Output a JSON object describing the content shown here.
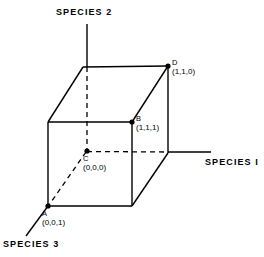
{
  "figure": {
    "type": "3d-cube-diagram",
    "background_color": "#ffffff",
    "line_color": "#000000"
  },
  "axes": {
    "species_1": {
      "label": "SPECIES I",
      "direction": "right",
      "solid_from_x": 168,
      "end_x": 210,
      "y": 152
    },
    "species_2": {
      "label": "SPECIES 2",
      "direction": "up",
      "x": 87,
      "top_y": 24
    },
    "species_3": {
      "label": "SPECIES 3",
      "direction": "down-left",
      "end_x": 27,
      "end_y": 234
    }
  },
  "vertices": [
    {
      "id": "A",
      "name": "A",
      "coord": "(0,0,1)",
      "px": 48,
      "py": 206,
      "dot": true
    },
    {
      "id": "B",
      "name": "B",
      "coord": "(1,1,1)",
      "px": 132,
      "py": 122,
      "dot": true
    },
    {
      "id": "C",
      "name": "C",
      "coord": "(0,0,0)",
      "px": 87,
      "py": 151,
      "dot": true
    },
    {
      "id": "D",
      "name": "D",
      "coord": "(1,1,0)",
      "px": 168,
      "py": 66,
      "dot": true
    }
  ],
  "cube": {
    "front_face": {
      "left": 48,
      "right": 132,
      "top": 122,
      "bottom": 206
    },
    "back_face": {
      "left": 83,
      "right": 168,
      "top": 67,
      "bottom": 151
    },
    "solid_edges": 9,
    "dashed_edges": 3
  }
}
